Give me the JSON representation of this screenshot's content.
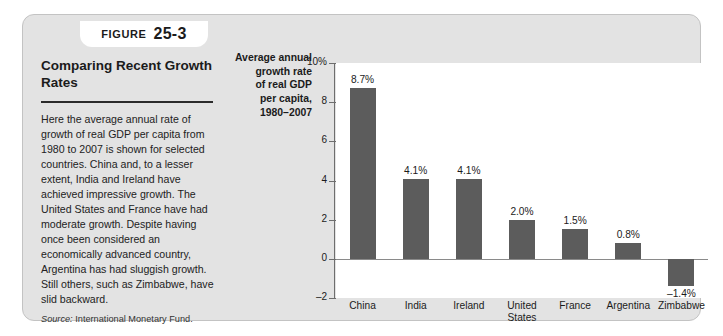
{
  "figure": {
    "tab_word": "Figure",
    "tab_number": "25-3",
    "heading": "Comparing Recent\nGrowth Rates",
    "body": "Here the average annual rate of growth of real GDP per capita from 1980 to 2007 is shown for selected countries. China and, to a lesser extent, India and Ireland have achieved impressive growth. The United States and France have had moderate growth. Despite having once been considered an economically advanced country, Argentina has had sluggish growth. Still others, such as Zimbabwe, have slid backward.",
    "source_label": "Source:",
    "source_text": "International Monetary Fund."
  },
  "colors": {
    "panel_background": "#e3e3e3",
    "plot_background": "#ffffff",
    "bar_fill": "#5c5c5c",
    "axis_line": "#6e6e6e",
    "text": "#1b1b1b"
  },
  "chart_data": {
    "type": "bar",
    "title": "",
    "xlabel": "",
    "ylabel": "Average annual\ngrowth rate\nof real GDP\nper capita,\n1980–2007",
    "categories": [
      "China",
      "India",
      "Ireland",
      "United\nStates",
      "France",
      "Argentina",
      "Zimbabwe"
    ],
    "values": [
      8.7,
      4.1,
      4.1,
      2.0,
      1.5,
      0.8,
      -1.4
    ],
    "value_labels": [
      "8.7%",
      "4.1%",
      "4.1%",
      "2.0%",
      "1.5%",
      "0.8%",
      "–1.4%"
    ],
    "ylim": [
      -2,
      10
    ],
    "yticks": [
      10,
      8,
      6,
      4,
      2,
      0,
      -2
    ],
    "ytick_labels": [
      "10%",
      "8",
      "6",
      "4",
      "2",
      "0",
      "–2"
    ],
    "grid": false,
    "legend": false,
    "legend_position": "none"
  }
}
